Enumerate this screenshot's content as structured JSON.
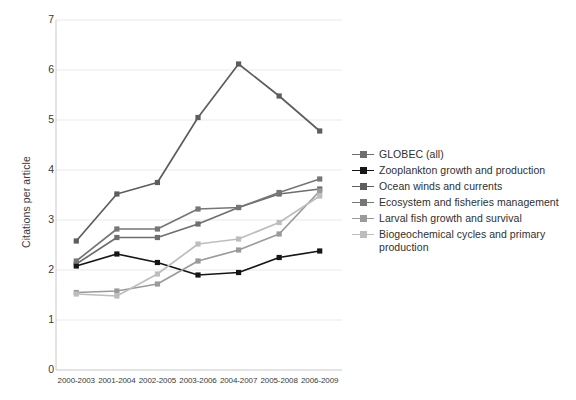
{
  "chart_data": {
    "type": "line",
    "title": "",
    "xlabel": "",
    "ylabel": "Citations per article",
    "ylim": [
      0,
      7
    ],
    "yticks": [
      0,
      1,
      2,
      3,
      4,
      5,
      6,
      7
    ],
    "grid": true,
    "legend_position": "right",
    "categories": [
      "2000-2003",
      "2001-2004",
      "2002-2005",
      "2003-2006",
      "2004-2007",
      "2005-2008",
      "2006-2009"
    ],
    "series": [
      {
        "name": "GLOBEC (all)",
        "color": "#6e6e6e",
        "marker": "square",
        "values": [
          2.12,
          2.65,
          2.65,
          2.92,
          3.25,
          3.52,
          3.62
        ]
      },
      {
        "name": "Zooplankton growth and production",
        "color": "#161616",
        "marker": "square",
        "values": [
          2.08,
          2.32,
          2.15,
          1.9,
          1.95,
          2.25,
          2.38
        ]
      },
      {
        "name": "Ocean winds and currents",
        "color": "#5d5d5d",
        "marker": "square",
        "values": [
          2.58,
          3.52,
          3.75,
          5.05,
          6.12,
          5.48,
          4.78
        ]
      },
      {
        "name": "Ecosystem and fisheries management",
        "color": "#767676",
        "marker": "square",
        "values": [
          2.18,
          2.82,
          2.82,
          3.22,
          3.25,
          3.55,
          3.82
        ]
      },
      {
        "name": "Larval fish growth and survival",
        "color": "#9a9a9a",
        "marker": "square",
        "values": [
          1.55,
          1.58,
          1.72,
          2.18,
          2.4,
          2.72,
          3.58
        ]
      },
      {
        "name": "Biogeochemical cycles and primary production",
        "color": "#bdbdbd",
        "marker": "square",
        "values": [
          1.52,
          1.48,
          1.92,
          2.52,
          2.62,
          2.95,
          3.48
        ]
      }
    ]
  },
  "axis": {
    "ylabel": "Citations per article",
    "yticks": [
      "7",
      "6",
      "5",
      "4",
      "3",
      "2",
      "1",
      "0"
    ],
    "xticks": [
      "2000-2003",
      "2001-2004",
      "2002-2005",
      "2003-2006",
      "2004-2007",
      "2005-2008",
      "2006-2009"
    ]
  },
  "legend": {
    "items": [
      {
        "label": "GLOBEC (all)",
        "color": "#6e6e6e"
      },
      {
        "label": "Zooplankton growth and production",
        "color": "#161616"
      },
      {
        "label": "Ocean winds and currents",
        "color": "#5d5d5d"
      },
      {
        "label": "Ecosystem and fisheries management",
        "color": "#767676"
      },
      {
        "label": "Larval fish growth and survival",
        "color": "#9a9a9a"
      },
      {
        "label": "Biogeochemical cycles and primary production",
        "color": "#bdbdbd"
      }
    ]
  },
  "caption": ""
}
